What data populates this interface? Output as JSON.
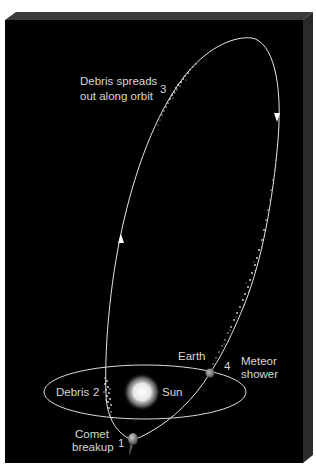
{
  "figure": {
    "background_color": "#000000",
    "line_color": "#e0e0e0"
  },
  "stages": [
    {
      "number": "1",
      "label_line1": "Comet",
      "label_line2": "breakup"
    },
    {
      "number": "2",
      "label": "Debris"
    },
    {
      "number": "3",
      "label_line1": "Debris spreads",
      "label_line2": "out along orbit"
    },
    {
      "number": "4",
      "label_line1": "Meteor",
      "label_line2": "shower"
    }
  ],
  "bodies": {
    "sun": "Sun",
    "earth": "Earth"
  },
  "icons": {
    "orbit_arrow_down": "arrow-down-icon",
    "orbit_arrow_up": "arrow-up-icon"
  }
}
